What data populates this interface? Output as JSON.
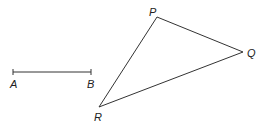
{
  "diagram": {
    "type": "geometry",
    "segment": {
      "from": "A",
      "to": "B",
      "points": {
        "A": [
          13,
          72
        ],
        "B": [
          91,
          72
        ]
      },
      "labels": {
        "A": "A",
        "B": "B"
      }
    },
    "triangle": {
      "vertices": {
        "P": [
          157,
          17
        ],
        "Q": [
          243,
          52
        ],
        "R": [
          99,
          107
        ]
      },
      "labels": {
        "P": "P",
        "Q": "Q",
        "R": "R"
      }
    },
    "colors": {
      "stroke": "#333333",
      "text": "#222222",
      "background": "#ffffff"
    }
  }
}
